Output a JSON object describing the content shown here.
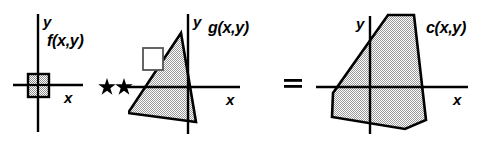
{
  "figure": {
    "width": 486,
    "height": 142,
    "background_color": "#ffffff",
    "stroke_color": "#000000",
    "shape_fill_color": "#b3b3b3",
    "shape_fill_pattern": "checkered-gray"
  },
  "panels": [
    {
      "id": "panel-f",
      "function_label": "f(x,y)",
      "x_axis_label": "x",
      "y_axis_label": "y",
      "shape": "small-square",
      "shape_fill": "hatched",
      "origin": {
        "x": 38,
        "y": 85
      }
    },
    {
      "id": "panel-g",
      "function_label": "g(x,y)",
      "x_axis_label": "x",
      "y_axis_label": "y",
      "shape": "triangle",
      "shape_fill": "hatched",
      "has_reference_square": true,
      "origin": {
        "x": 188,
        "y": 87
      }
    },
    {
      "id": "panel-c",
      "function_label": "c(x,y)",
      "x_axis_label": "x",
      "y_axis_label": "y",
      "shape": "hexagon",
      "shape_fill": "hatched",
      "origin": {
        "x": 370,
        "y": 87
      }
    }
  ],
  "operators": [
    {
      "id": "convolution",
      "symbol": "★★",
      "meaning": "two-dimensional convolution"
    },
    {
      "id": "equals",
      "symbol": "=",
      "meaning": "equals"
    }
  ]
}
